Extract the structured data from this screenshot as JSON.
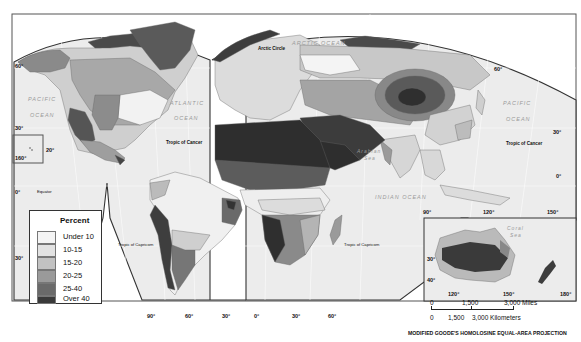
{
  "map": {
    "projection": "MODIFIED GOODE'S HOMOLOSINE EQUAL-AREA PROJECTION",
    "ocean_labels": {
      "pacific_west": [
        "PACIFIC",
        "OCEAN"
      ],
      "atlantic": [
        "ATLANTIC",
        "OCEAN"
      ],
      "arctic": "ARCTIC OCEAN",
      "pacific_east": [
        "PACIFIC",
        "OCEAN"
      ],
      "indian": "INDIAN   OCEAN",
      "arabian_sea": [
        "Arabian",
        "Sea"
      ],
      "coral_sea": [
        "Coral",
        "Sea"
      ]
    },
    "line_labels": {
      "arctic_circle": "Arctic Circle",
      "tropic_cancer_west": "Tropic of Cancer",
      "tropic_cancer_east": "Tropic of Cancer",
      "equator": "Equator",
      "tropic_capricorn_west": "Tropic of Capricorn",
      "tropic_capricorn_east": "Tropic of Capricorn"
    },
    "latitude_labels": {
      "west_60": "60°",
      "west_30": "30°",
      "west_0": "0°",
      "west_s30": "30°",
      "hawaii_20": "20°",
      "hawaii_160": "160°",
      "east_60": "60°",
      "east_30": "30°",
      "east_0": "0°",
      "aus_30": "30°",
      "aus_40": "40°"
    },
    "longitude_labels": {
      "bottom_90w": "90°",
      "bottom_60w": "60°",
      "bottom_30w": "30°",
      "bottom_0": "0°",
      "bottom_30e": "30°",
      "bottom_60e": "60°",
      "asia_90": "90°",
      "asia_120": "120°",
      "asia_150": "150°",
      "aus_120": "120°",
      "aus_150": "150°",
      "aus_180": "180°"
    }
  },
  "legend": {
    "title": "Percent",
    "items": [
      {
        "label": "Under 10",
        "color": "#f4f4f4"
      },
      {
        "label": "10-15",
        "color": "#e2e2e2"
      },
      {
        "label": "15-20",
        "color": "#c2c2c2"
      },
      {
        "label": "20-25",
        "color": "#9a9a9a"
      },
      {
        "label": "25-40",
        "color": "#6a6a6a"
      },
      {
        "label": "Over 40",
        "color": "#3a3a3a"
      }
    ]
  },
  "scale": {
    "miles_label": "3,000 Miles",
    "miles_0": "0",
    "miles_mid": "1,500",
    "km_label": "3,000 Kilometers",
    "km_0": "0",
    "km_mid": "1,500"
  }
}
